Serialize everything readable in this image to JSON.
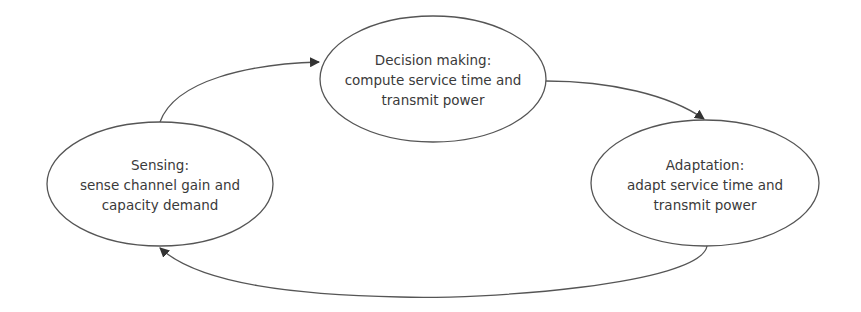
{
  "diagram": {
    "type": "cycle",
    "colors": {
      "stroke": "#555555",
      "text": "#3a3a3a",
      "background": "#ffffff"
    },
    "nodes": [
      {
        "id": "sensing",
        "title": "Sensing:",
        "line1": "sense channel gain and",
        "line2": "capacity demand"
      },
      {
        "id": "decision",
        "title": "Decision making:",
        "line1": "compute service time and",
        "line2": "transmit power"
      },
      {
        "id": "adaptation",
        "title": "Adaptation:",
        "line1": "adapt service time and",
        "line2": "transmit power"
      }
    ],
    "edges": [
      {
        "from": "sensing",
        "to": "decision"
      },
      {
        "from": "decision",
        "to": "adaptation"
      },
      {
        "from": "adaptation",
        "to": "sensing"
      }
    ]
  }
}
